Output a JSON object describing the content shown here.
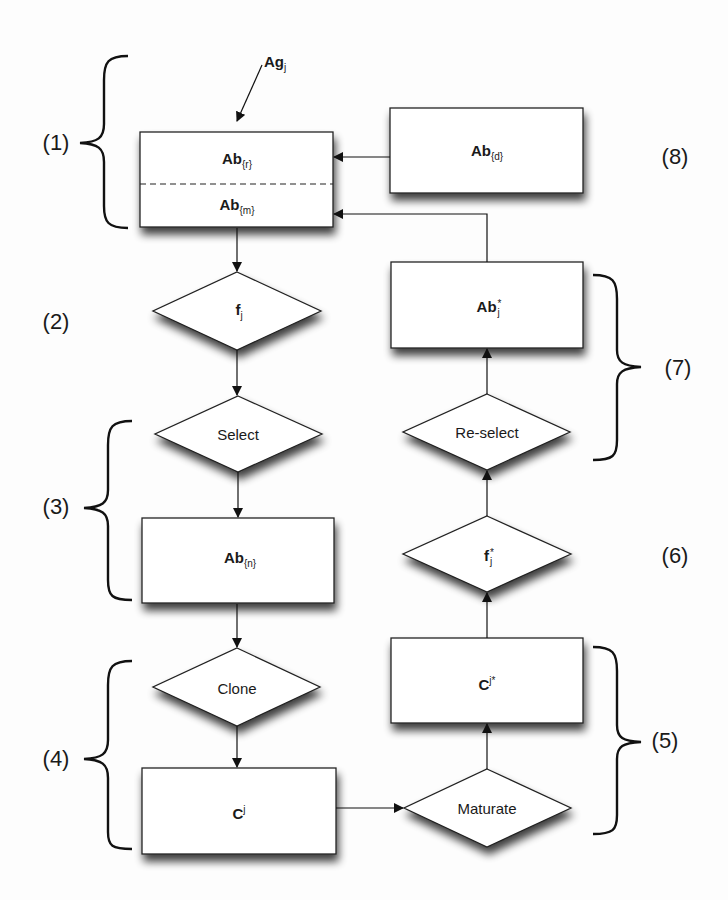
{
  "diagram": {
    "type": "flowchart",
    "input": {
      "base": "Ag",
      "sub": "j"
    },
    "nodes": {
      "memory": {
        "shape": "rect",
        "top": {
          "base": "Ab",
          "sub": "{r}"
        },
        "bottom": {
          "base": "Ab",
          "sub": "{m}"
        }
      },
      "ab_d": {
        "shape": "rect",
        "base": "Ab",
        "sub": "{d}"
      },
      "f_j": {
        "shape": "diamond",
        "base": "f",
        "sub": "j"
      },
      "select": {
        "shape": "diamond",
        "label": "Select"
      },
      "ab_n": {
        "shape": "rect",
        "base": "Ab",
        "sub": "{n}"
      },
      "clone": {
        "shape": "diamond",
        "label": "Clone"
      },
      "c_j": {
        "shape": "rect",
        "base": "C",
        "sup": "j"
      },
      "maturate": {
        "shape": "diamond",
        "label": "Maturate"
      },
      "c_j_star": {
        "shape": "rect",
        "base": "C",
        "sup": "j*"
      },
      "f_j_star": {
        "shape": "diamond",
        "base": "f",
        "sub": "j",
        "sup": "*"
      },
      "reselect": {
        "shape": "diamond",
        "label": "Re-select"
      },
      "ab_j_star": {
        "shape": "rect",
        "base": "Ab",
        "sub": "j",
        "sup": "*"
      }
    },
    "edges": [
      [
        "input",
        "memory"
      ],
      [
        "ab_d",
        "memory.top"
      ],
      [
        "ab_j_star",
        "memory.bottom"
      ],
      [
        "memory",
        "f_j"
      ],
      [
        "f_j",
        "select"
      ],
      [
        "select",
        "ab_n"
      ],
      [
        "ab_n",
        "clone"
      ],
      [
        "clone",
        "c_j"
      ],
      [
        "c_j",
        "maturate"
      ],
      [
        "maturate",
        "c_j_star"
      ],
      [
        "c_j_star",
        "f_j_star"
      ],
      [
        "f_j_star",
        "reselect"
      ],
      [
        "reselect",
        "ab_j_star"
      ]
    ],
    "steps": [
      "(1)",
      "(2)",
      "(3)",
      "(4)",
      "(5)",
      "(6)",
      "(7)",
      "(8)"
    ]
  }
}
